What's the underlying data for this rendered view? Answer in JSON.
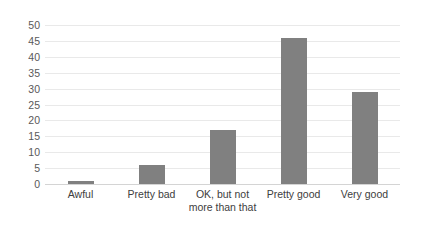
{
  "chart_data": {
    "type": "bar",
    "title": "",
    "xlabel": "",
    "ylabel": "",
    "categories": [
      "Awful",
      "Pretty bad",
      "OK, but not more than that",
      "Pretty good",
      "Very good"
    ],
    "values": [
      1,
      6,
      17,
      46,
      29
    ],
    "ylim": [
      0,
      50
    ],
    "ytick_labels": [
      "0",
      "5",
      "10",
      "15",
      "20",
      "25",
      "30",
      "35",
      "40",
      "45",
      "50"
    ],
    "ytick_values": [
      0,
      5,
      10,
      15,
      20,
      25,
      30,
      35,
      40,
      45,
      50
    ],
    "grid": true,
    "legend": false,
    "legend_position": "none",
    "bar_color": "#808080",
    "gridline_color": "#e9e9e9",
    "axis_text_color": "#595959",
    "background_color": "#ffffff"
  }
}
